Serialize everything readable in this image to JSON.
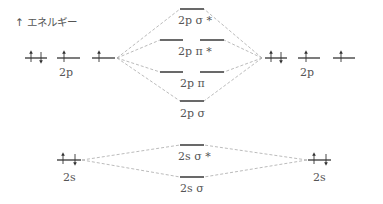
{
  "axis": {
    "label": "↑ エネルギー",
    "meaning": "energy"
  },
  "atomic_orbitals": {
    "left_2p": {
      "label": "2p",
      "electrons": [
        "↑↓",
        "↑",
        "↑"
      ]
    },
    "right_2p": {
      "label": "2p",
      "electrons": [
        "↑↓",
        "↑",
        "↑"
      ]
    },
    "left_2s": {
      "label": "2s",
      "electrons": [
        "↑↓"
      ]
    },
    "right_2s": {
      "label": "2s",
      "electrons": [
        "↑↓"
      ]
    }
  },
  "molecular_orbitals": [
    {
      "id": "sigma2p_star",
      "label": "2p σ *",
      "degeneracy": 1,
      "electrons": 0
    },
    {
      "id": "pi2p_star",
      "label": "2p π *",
      "degeneracy": 2,
      "electrons": 0
    },
    {
      "id": "pi2p",
      "label": "2p π",
      "degeneracy": 2,
      "electrons": 0
    },
    {
      "id": "sigma2p",
      "label": "2p σ",
      "degeneracy": 1,
      "electrons": 0
    },
    {
      "id": "sigma2s_star",
      "label": "2s σ *",
      "degeneracy": 1,
      "electrons": 0
    },
    {
      "id": "sigma2s",
      "label": "2s σ",
      "degeneracy": 1,
      "electrons": 0
    }
  ],
  "colors": {
    "level_line": "#444444",
    "connector": "#aaaaaa",
    "text": "#555555"
  }
}
